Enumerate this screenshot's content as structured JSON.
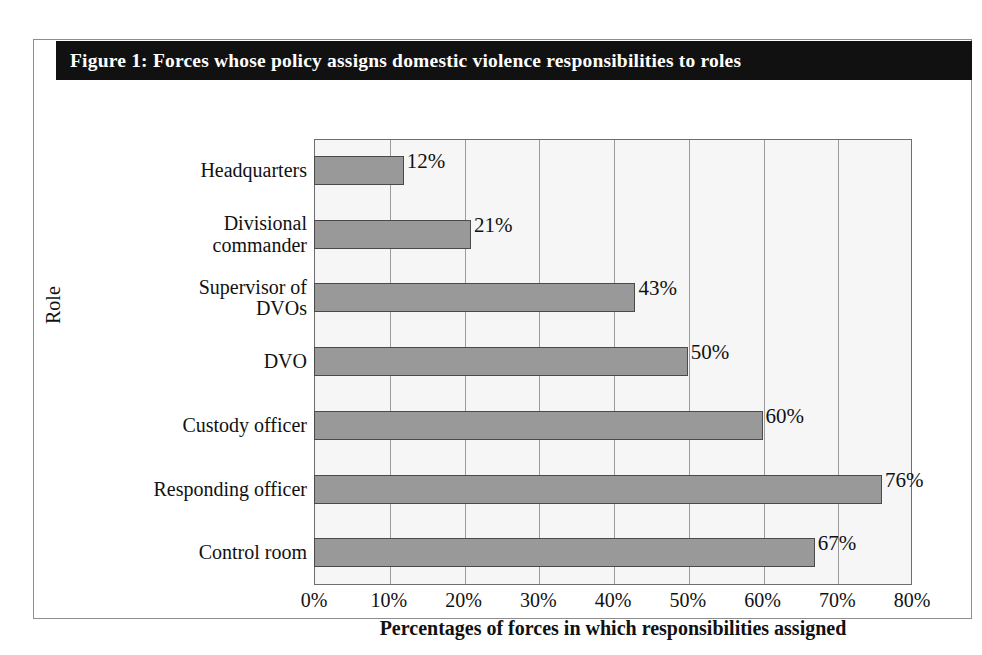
{
  "figure": {
    "title": "Figure 1: Forces whose policy assigns domestic violence responsibilities to roles"
  },
  "chart_data": {
    "type": "bar",
    "orientation": "horizontal",
    "title": "Figure 1: Forces whose policy assigns domestic violence responsibilities to roles",
    "xlabel": "Percentages of forces in which responsibilities assigned",
    "ylabel": "Role",
    "xlim": [
      0,
      80
    ],
    "xticks": [
      "0%",
      "10%",
      "20%",
      "30%",
      "40%",
      "50%",
      "60%",
      "70%",
      "80%"
    ],
    "xtick_values": [
      0,
      10,
      20,
      30,
      40,
      50,
      60,
      70,
      80
    ],
    "grid": "vertical",
    "legend": "none",
    "categories": [
      "Headquarters",
      "Divisional commander",
      "Supervisor of DVOs",
      "DVO",
      "Custody officer",
      "Responding officer",
      "Control room"
    ],
    "values": [
      12,
      21,
      43,
      50,
      60,
      76,
      67
    ],
    "data_labels": [
      "12%",
      "21%",
      "43%",
      "50%",
      "60%",
      "76%",
      "67%"
    ],
    "colors": {
      "bar_fill": "#999999",
      "bar_edge": "#4a4a4a",
      "plot_background": "#f6f6f6",
      "gridline": "#9a9a9a",
      "title_bar_background": "#111111",
      "title_text": "#ffffff",
      "frame_border": "#8d8d8d"
    }
  },
  "category_lines": [
    [
      "Headquarters"
    ],
    [
      "Divisional",
      "commander"
    ],
    [
      "Supervisor of",
      "DVOs"
    ],
    [
      "DVO"
    ],
    [
      "Custody officer"
    ],
    [
      "Responding officer"
    ],
    [
      "Control room"
    ]
  ]
}
